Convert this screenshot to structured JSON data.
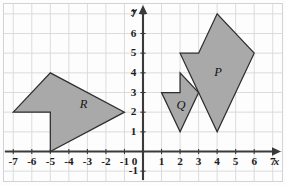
{
  "figure": {
    "background_color": "#fdfdfd",
    "shape_fill_color": "#a9a9a9",
    "shape_stroke_color": "#2e2e2e",
    "grid_color": "#d8d8da",
    "axis_color": "#3a3a3a"
  },
  "chart_data": {
    "type": "scatter",
    "title": "",
    "xlabel": "x",
    "ylabel": "y",
    "xlim": [
      -7.5,
      7.5
    ],
    "ylim": [
      -1.5,
      7.5
    ],
    "grid": true,
    "legend": "none",
    "x_ticks": [
      -7,
      -6,
      -5,
      -4,
      -3,
      -2,
      -1,
      0,
      1,
      2,
      3,
      4,
      5,
      6,
      7
    ],
    "x_tick_labels": [
      "-7",
      "-6",
      "-5",
      "-4",
      "-3",
      "-2",
      "-1",
      "0",
      "1",
      "2",
      "3",
      "4",
      "5",
      "6",
      "7"
    ],
    "y_ticks": [
      -1,
      1,
      2,
      3,
      4,
      5,
      6,
      7
    ],
    "y_tick_labels": [
      "-1",
      "1",
      "2",
      "3",
      "4",
      "5",
      "6",
      "7"
    ],
    "origin_label": "0",
    "shapes": [
      {
        "name": "P",
        "label": "P",
        "label_position": [
          4.05,
          4.0
        ],
        "vertices": [
          [
            2,
            5
          ],
          [
            3,
            5
          ],
          [
            4,
            7
          ],
          [
            6,
            5
          ],
          [
            4,
            1
          ]
        ]
      },
      {
        "name": "Q",
        "label": "Q",
        "label_position": [
          2.05,
          2.3
        ],
        "vertices": [
          [
            1,
            3
          ],
          [
            2,
            3
          ],
          [
            2,
            4
          ],
          [
            3,
            3
          ],
          [
            2,
            1
          ]
        ]
      },
      {
        "name": "R",
        "label": "R",
        "label_position": [
          -3.2,
          2.35
        ],
        "vertices": [
          [
            -7,
            2
          ],
          [
            -5,
            4
          ],
          [
            -1,
            2
          ],
          [
            -5,
            0
          ],
          [
            -5,
            2
          ]
        ]
      }
    ]
  }
}
